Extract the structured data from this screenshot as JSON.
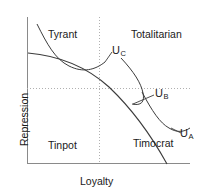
{
  "figure": {
    "background_color": "#ffffff",
    "axis_color": "#8a8a8a",
    "curve_color": "#3c3c3c",
    "guide_color": "#b0b0b0",
    "text_color": "#1a1a1a"
  },
  "axes": {
    "x_label": "Loyalty",
    "y_label": "Repression",
    "x_origin_px": 27,
    "x_end_px": 190,
    "y_top_px": 17,
    "y_bottom_px": 163
  },
  "guides": {
    "vertical_dotted_x_px": 99,
    "horizontal_dotted_y_px": 88,
    "style": "dotted"
  },
  "regions": [
    {
      "name": "tyrant",
      "label": "Tyrant",
      "x_px": 48,
      "y_px": 30
    },
    {
      "name": "totalitarian",
      "label": "Totalitarian",
      "x_px": 131,
      "y_px": 30
    },
    {
      "name": "tinpot",
      "label": "Tinpot",
      "x_px": 48,
      "y_px": 140
    },
    {
      "name": "timocrat",
      "label": "Timocrat",
      "x_px": 133,
      "y_px": 138
    }
  ],
  "curves": [
    {
      "name": "budget-constraint",
      "description": "downward sloping convex trade-off frontier from upper-left to lower-right",
      "path": "M 28,53 C 60,56 86,66 108,85 C 130,105 150,134 167,163",
      "label": null
    },
    {
      "name": "indifference-curve-UC",
      "description": "indifference curve tangent in upper-left Tyrant region",
      "path": "M 37,24 C 48,42 56,58 70,65 C 84,72 95,70 104,63",
      "label": "U",
      "subscript": "C",
      "label_x_px": 112,
      "label_y_px": 47
    },
    {
      "name": "indifference-curve-UB",
      "description": "indifference curve tangent near the centre-right of the frontier",
      "path": "M 121,61 C 133,72 140,82 142,92 C 144,101 141,105 133,104",
      "label": "U",
      "subscript": "B",
      "label_x_px": 155,
      "label_y_px": 90
    },
    {
      "name": "indifference-curve-UA",
      "description": "indifference curve tangent in lower-right Timocrat region",
      "path": "M 141,92 C 152,110 160,122 168,127 C 176,132 183,132 189,129",
      "label": "U",
      "subscript": "A",
      "label_x_px": 180,
      "label_y_px": 130
    }
  ],
  "leaders": [
    {
      "name": "leader-UC",
      "path": "M 106,62 L 112,53"
    },
    {
      "name": "leader-UB",
      "path": "M 137,105 L 155,96"
    },
    {
      "name": "leader-UA",
      "path": "M 170,128 L 181,134"
    }
  ]
}
